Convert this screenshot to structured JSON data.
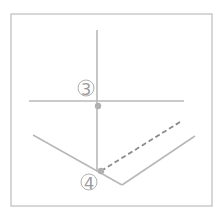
{
  "diagram": {
    "frame": {
      "x": 11,
      "y": 14,
      "width": 201,
      "height": 192,
      "color": "#bdbdbd"
    },
    "line_color": "#b8b8b8",
    "dash_color": "#8c8c8c",
    "dot_color": "#b0b0b0",
    "vertical_line": {
      "x1": 97,
      "y1": 30,
      "x2": 97,
      "y2": 171
    },
    "horizontal_line": {
      "x1": 29,
      "y1": 101,
      "x2": 184,
      "y2": 101
    },
    "left_diagonal": {
      "x1": 33,
      "y1": 135,
      "x2": 122,
      "y2": 185
    },
    "right_diagonal": {
      "x1": 122,
      "y1": 185,
      "x2": 195,
      "y2": 136
    },
    "dashed_line": {
      "x1": 101,
      "y1": 171,
      "x2": 180,
      "y2": 122
    },
    "dots": [
      {
        "cx": 98,
        "cy": 106,
        "r": 3.2
      },
      {
        "cx": 101,
        "cy": 171,
        "r": 3.2
      }
    ],
    "labels": [
      {
        "text": "3",
        "cx": 86,
        "cy": 88
      },
      {
        "text": "4",
        "cx": 89,
        "cy": 182
      }
    ]
  }
}
